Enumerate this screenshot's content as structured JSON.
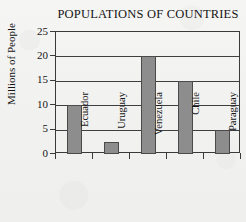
{
  "chart_data": {
    "type": "bar",
    "title": "POPULATIONS OF COUNTRIES",
    "xlabel": "",
    "ylabel": "Millions of People",
    "categories": [
      "Ecuador",
      "Uruguay",
      "Venezuela",
      "Chile",
      "Paraguay"
    ],
    "values": [
      10,
      2.5,
      20,
      15,
      5
    ],
    "ylim": [
      0,
      25
    ],
    "yticks": [
      0,
      5,
      10,
      15,
      20,
      25
    ],
    "ytick_labels": [
      "0",
      "5",
      "10",
      "15",
      "20",
      "25"
    ],
    "grid": true,
    "legend": false,
    "colors": {
      "bar_fill": "#8d8d8d",
      "bar_stroke": "#4a4a4a",
      "axis": "#3a3a3a",
      "grid": "#3f3f3f",
      "text": "#151515",
      "background": "#f3f3f2"
    }
  }
}
